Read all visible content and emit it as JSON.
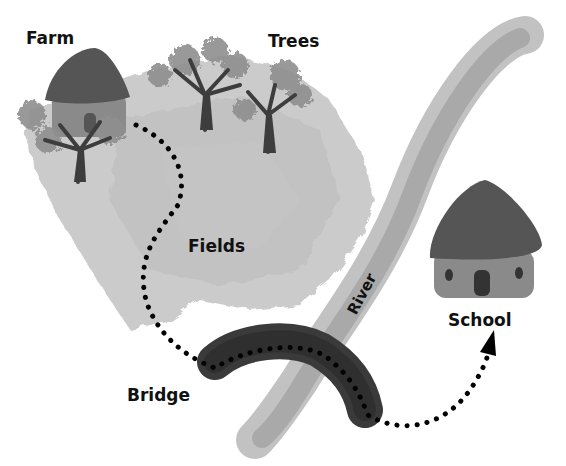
{
  "map": {
    "title": "Route from Farm to School",
    "style": "grayscale illustration",
    "colors": {
      "background": "#ffffff",
      "fields": "#c8c8c8",
      "fields_dark": "#b4b4b4",
      "river_outer": "#bdbdbd",
      "river_inner": "#a8a8a8",
      "bridge": "#3a3a3a",
      "roof": "#555555",
      "wall": "#8a8a8a",
      "trunk": "#3d3d3d",
      "foliage": "#8f8f8f",
      "path_dots": "#000000",
      "label": "#111111"
    },
    "labels": {
      "farm": "Farm",
      "trees": "Trees",
      "fields": "Fields",
      "river": "River",
      "bridge": "Bridge",
      "school": "School"
    },
    "route": {
      "start": "Farm",
      "via": [
        "Fields",
        "Bridge"
      ],
      "end": "School",
      "style": "dotted line with arrowhead"
    }
  }
}
